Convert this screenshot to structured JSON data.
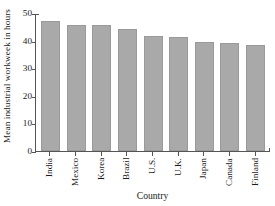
{
  "chart_data": {
    "type": "bar",
    "title": "",
    "xlabel": "Country",
    "ylabel": "Mean industrial workweek in hours",
    "categories": [
      "India",
      "Mexico",
      "Korea",
      "Brazil",
      "U.S.",
      "U.K.",
      "Japan",
      "Canada",
      "Finland"
    ],
    "values": [
      47,
      45.6,
      45.6,
      44.2,
      41.5,
      41.3,
      39.4,
      39.0,
      38.4
    ],
    "ylim": [
      0,
      50
    ],
    "yticks": [
      0,
      10,
      20,
      30,
      40,
      50
    ],
    "ytick_labels": [
      "0",
      "10",
      "20",
      "30",
      "40",
      "50"
    ],
    "grid": false,
    "legend": false,
    "bar_color": "#a9a9a9",
    "axis_color": "#555555",
    "background": "#ffffff"
  }
}
